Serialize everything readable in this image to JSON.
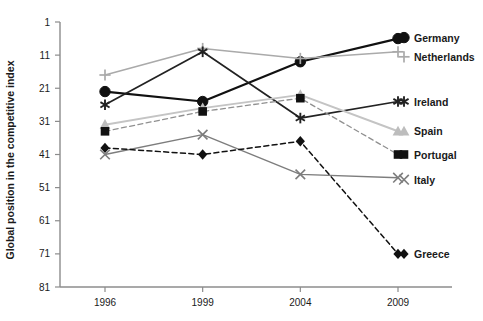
{
  "chart_data": {
    "type": "line",
    "title": "",
    "subtitle": "",
    "xlabel": "",
    "ylabel": "Global position in the competitive index",
    "x": [
      "1996",
      "1999",
      "2004",
      "2009"
    ],
    "categories": [
      "1996",
      "1999",
      "2004",
      "2009"
    ],
    "y_ticks": [
      1,
      11,
      21,
      31,
      41,
      51,
      61,
      71,
      81
    ],
    "y_tick_labels": [
      "1",
      "11",
      "21",
      "31",
      "41",
      "51",
      "61",
      "71",
      "81"
    ],
    "ylim": [
      1,
      81
    ],
    "y_inverted": true,
    "grid": false,
    "legend_position": "right-inline-at-line-ends",
    "series": [
      {
        "name": "Germany",
        "values": [
          22,
          25,
          13,
          6
        ],
        "marker": "circle",
        "color": "#111111",
        "linestyle": "solid",
        "linewidth": 2.2
      },
      {
        "name": "Netherlands",
        "values": [
          17,
          9,
          12,
          10
        ],
        "marker": "plus",
        "color": "#aaaaaa",
        "linestyle": "solid",
        "linewidth": 1.6
      },
      {
        "name": "Ireland",
        "values": [
          26,
          10,
          30,
          25
        ],
        "marker": "asterisk",
        "color": "#222222",
        "linestyle": "solid",
        "linewidth": 1.7
      },
      {
        "name": "Spain",
        "values": [
          32,
          27,
          23,
          34
        ],
        "marker": "triangle",
        "color": "#c4c4c4",
        "linestyle": "solid",
        "linewidth": 2.0
      },
      {
        "name": "Portugal",
        "values": [
          34,
          28,
          24,
          41
        ],
        "marker": "square",
        "color": "#909090",
        "linestyle": "dashed",
        "linewidth": 1.3
      },
      {
        "name": "Italy",
        "values": [
          41,
          35,
          47,
          48
        ],
        "marker": "cross",
        "color": "#7d7d7d",
        "linestyle": "solid",
        "linewidth": 1.4
      },
      {
        "name": "Greece",
        "values": [
          39,
          41,
          37,
          71
        ],
        "marker": "diamond",
        "color": "#111111",
        "linestyle": "dashed",
        "linewidth": 1.5
      }
    ]
  },
  "axes": {
    "y_title": "Global position in the competitive index",
    "x_tick_labels": [
      "1996",
      "1999",
      "2004",
      "2009"
    ],
    "y_tick_labels": [
      "1",
      "11",
      "21",
      "31",
      "41",
      "51",
      "61",
      "71",
      "81"
    ]
  },
  "legend": {
    "items": [
      {
        "label": "Germany",
        "marker": "circle",
        "color": "#111111"
      },
      {
        "label": "Netherlands",
        "marker": "plus",
        "color": "#aaaaaa"
      },
      {
        "label": "Ireland",
        "marker": "asterisk",
        "color": "#222222"
      },
      {
        "label": "Spain",
        "marker": "triangle",
        "color": "#c4c4c4"
      },
      {
        "label": "Portugal",
        "marker": "square",
        "color": "#111111"
      },
      {
        "label": "Italy",
        "marker": "cross",
        "color": "#7d7d7d"
      },
      {
        "label": "Greece",
        "marker": "diamond",
        "color": "#111111"
      }
    ]
  },
  "colors": {
    "axis": "#8c8c8c",
    "text": "#1a1a1a",
    "background": "#ffffff"
  }
}
